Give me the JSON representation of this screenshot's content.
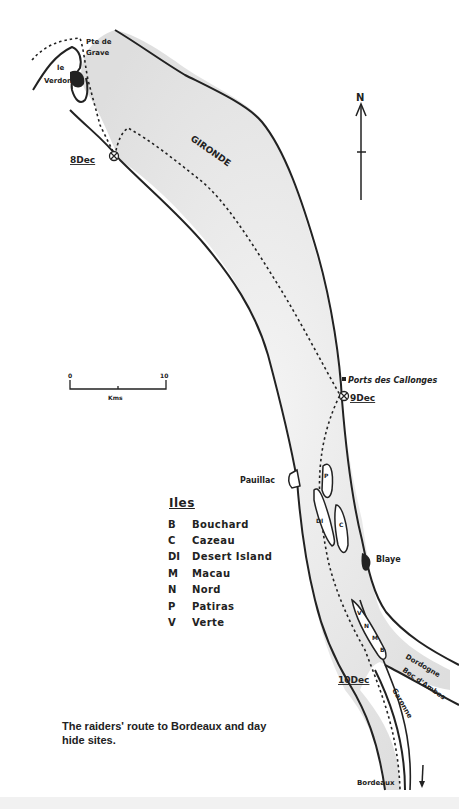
{
  "map": {
    "river_name": "GIRONDE",
    "north_label": "N",
    "scale": {
      "start_label": "0",
      "end_label": "10",
      "unit_label": "Kms"
    },
    "places": {
      "le_verdon_line1": "le",
      "le_verdon_line2": "Verdon",
      "pte_de_grave_line1": "Pte de",
      "pte_de_grave_line2": "Grave",
      "ports_des_callonges": "Ports des Callonges",
      "pauillac": "Pauillac",
      "blaye": "Blaye",
      "dordogne": "Dordogne",
      "bec_dambes": "Bec d'Ambes",
      "garonne": "Garonne",
      "bordeaux": "Bordeaux"
    },
    "hide_sites": [
      {
        "label": "8Dec"
      },
      {
        "label": "9Dec"
      },
      {
        "label": "10Dec"
      }
    ],
    "island_markers": [
      "P",
      "DI",
      "C",
      "V",
      "N",
      "M",
      "B",
      "C"
    ],
    "colors": {
      "ink": "#222222",
      "water": "#e6e6e6",
      "paper": "#ffffff"
    }
  },
  "legend": {
    "title": "Iles",
    "items": [
      {
        "code": "B",
        "name": "Bouchard"
      },
      {
        "code": "C",
        "name": "Cazeau"
      },
      {
        "code": "DI",
        "name": "Desert Island"
      },
      {
        "code": "M",
        "name": "Macau"
      },
      {
        "code": "N",
        "name": "Nord"
      },
      {
        "code": "P",
        "name": "Patiras"
      },
      {
        "code": "V",
        "name": "Verte"
      }
    ]
  },
  "caption": "The raiders' route to Bordeaux and day hide sites."
}
